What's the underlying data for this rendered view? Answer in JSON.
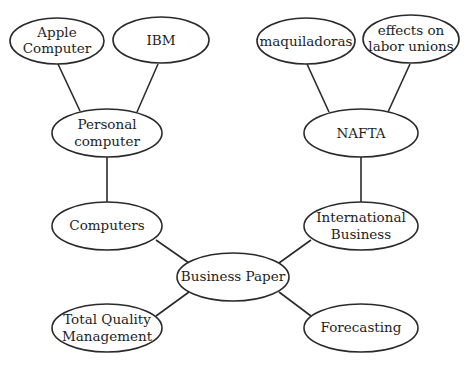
{
  "diagram": {
    "type": "cluster-map",
    "nodes": {
      "apple_computer": {
        "lines": [
          "Apple",
          "Computer"
        ]
      },
      "ibm": {
        "lines": [
          "IBM"
        ]
      },
      "personal_computer": {
        "lines": [
          "Personal",
          "computer"
        ]
      },
      "computers": {
        "lines": [
          "Computers"
        ]
      },
      "total_quality_management": {
        "lines": [
          "Total Quality",
          "Management"
        ]
      },
      "business_paper": {
        "lines": [
          "Business Paper"
        ]
      },
      "maquiladoras": {
        "lines": [
          "maquiladoras"
        ]
      },
      "effects_on_labor_unions": {
        "lines": [
          "effects on",
          "labor unions"
        ]
      },
      "nafta": {
        "lines": [
          "NAFTA"
        ]
      },
      "international_business": {
        "lines": [
          "International",
          "Business"
        ]
      },
      "forecasting": {
        "lines": [
          "Forecasting"
        ]
      }
    },
    "edges": [
      [
        "apple_computer",
        "personal_computer"
      ],
      [
        "ibm",
        "personal_computer"
      ],
      [
        "personal_computer",
        "computers"
      ],
      [
        "computers",
        "business_paper"
      ],
      [
        "total_quality_management",
        "business_paper"
      ],
      [
        "maquiladoras",
        "nafta"
      ],
      [
        "effects_on_labor_unions",
        "nafta"
      ],
      [
        "nafta",
        "international_business"
      ],
      [
        "international_business",
        "business_paper"
      ],
      [
        "forecasting",
        "business_paper"
      ]
    ]
  }
}
